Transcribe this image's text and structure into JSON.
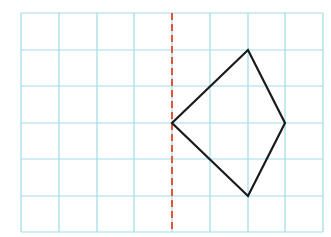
{
  "diagram": {
    "type": "grid-reflection",
    "grid": {
      "columns": 8,
      "rows": 6,
      "color": "#9fdbe6",
      "x_lines": [
        21,
        59,
        97,
        134,
        172,
        210,
        248,
        285,
        323
      ],
      "y_lines": [
        13,
        50,
        86,
        123,
        159,
        196,
        232
      ]
    },
    "mirror_line": {
      "style": "dashed",
      "color": "#e4533a",
      "grid_x": 4
    },
    "shape": {
      "type": "quadrilateral",
      "color": "#1a1a1a",
      "vertices_grid": [
        [
          4,
          3
        ],
        [
          6,
          1
        ],
        [
          7,
          3
        ],
        [
          6,
          5
        ]
      ]
    }
  }
}
